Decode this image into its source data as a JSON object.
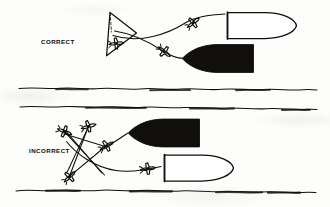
{
  "figure": {
    "kind": "instructional-diagram",
    "background_color": "#fdfdfb",
    "ink_color": "#100f0d",
    "panels": [
      {
        "id": "upper",
        "label": "CORRECT",
        "label_x": 41,
        "label_y": 38,
        "description": "Single coordinated approach: tracks fan out from one origin point to each ship",
        "origin_marker": {
          "type": "view-cone-triangle",
          "x": 108,
          "y": 12,
          "width": 28,
          "height": 44
        },
        "aircraft_count": 3,
        "ship_count": 2
      },
      {
        "id": "lower",
        "label": "INCORRECT",
        "label_x": 29,
        "label_y": 147,
        "description": "Crossing, uncoordinated approach tracks forming an X/star pattern",
        "aircraft_count": 5,
        "ship_count": 2
      }
    ],
    "ships": [
      {
        "panel": "upper",
        "fill": "white",
        "bow": "right",
        "x": 226,
        "y": 12,
        "width": 72,
        "height": 26
      },
      {
        "panel": "upper",
        "fill": "black",
        "bow": "left",
        "x": 182,
        "y": 44,
        "width": 74,
        "height": 28
      },
      {
        "panel": "lower",
        "fill": "black",
        "bow": "left",
        "x": 128,
        "y": 119,
        "width": 72,
        "height": 28
      },
      {
        "panel": "lower",
        "fill": "white",
        "bow": "right",
        "x": 162,
        "y": 155,
        "width": 70,
        "height": 27
      }
    ],
    "sea_lines": [
      {
        "y": 88,
        "label": "sea-surface-line-1"
      },
      {
        "y": 106,
        "label": "sea-surface-line-2"
      },
      {
        "y": 190,
        "label": "sea-surface-line-3"
      }
    ],
    "icons": {
      "aircraft": "aircraft-plan-view-icon",
      "view_cone": "view-cone-icon",
      "ship_white": "ship-outline-icon",
      "ship_black": "ship-silhouette-icon",
      "sea": "sea-surface-line-icon"
    }
  }
}
